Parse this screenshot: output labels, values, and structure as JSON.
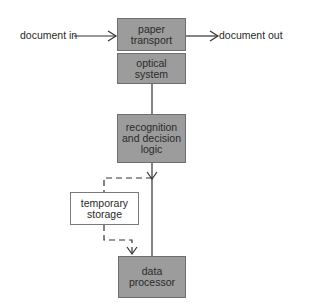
{
  "diagram": {
    "inputs": {
      "document_in": "document in",
      "document_out": "document out"
    },
    "nodes": {
      "paper_transport": "paper transport",
      "optical_system": "optical system",
      "recognition": "recognition and decision logic",
      "temporary_storage": "temporary storage",
      "data_processor": "data processor"
    },
    "colors": {
      "box_fill": "#9c9c9c",
      "line": "#333333",
      "storage_fill": "#ffffff"
    }
  }
}
